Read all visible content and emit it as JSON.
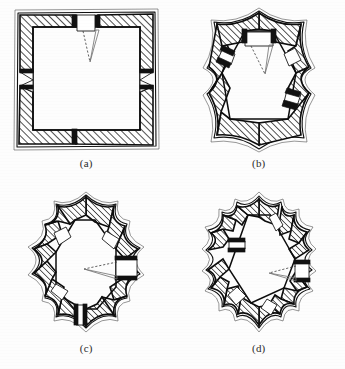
{
  "figure": {
    "kind": "scanned-line-drawing-plate",
    "background_color": "#fdfdfd",
    "ink_color": "#111111",
    "hatch_color": "#1a1a1a",
    "sight_line_color": "#6f6f6f",
    "panel_count": 4,
    "panels": [
      {
        "id": "a",
        "caption": "(a)",
        "plan_shape": "square",
        "point_count": 4,
        "courtyard_shape": "square",
        "gate_position": "top",
        "sight_lines": "dashed-and-solid-cone",
        "wall_fill": "diagonal-hatch"
      },
      {
        "id": "b",
        "caption": "(b)",
        "plan_shape": "hexagonal-star",
        "point_count": 6,
        "courtyard_shape": "hexagon",
        "gate_position": "top",
        "sight_lines": "dashed-and-solid-cone",
        "wall_fill": "diagonal-hatch"
      },
      {
        "id": "c",
        "caption": "(c)",
        "plan_shape": "octagonal-star",
        "point_count": 8,
        "courtyard_shape": "octagon",
        "gate_position": "right",
        "sight_lines": "dashed-and-solid-cone",
        "wall_fill": "diagonal-hatch"
      },
      {
        "id": "d",
        "caption": "(d)",
        "plan_shape": "hexagonal-star",
        "point_count": 12,
        "courtyard_shape": "hexagon",
        "gate_position": "right",
        "sight_lines": "dashed-and-solid-cone",
        "wall_fill": "diagonal-hatch"
      }
    ]
  }
}
